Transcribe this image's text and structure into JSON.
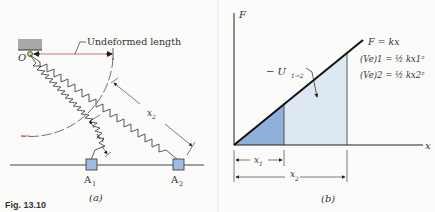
{
  "caption": "Fig. 13.10",
  "panel_a": {
    "label": "(a)",
    "pivot_label": "O",
    "undeformed_label": "Undeformed length",
    "block1_label": "A",
    "block1_sub": "1",
    "block2_label": "A",
    "block2_sub": "2",
    "x1_label": "x",
    "x1_sub": "1",
    "x2_label": "x",
    "x2_sub": "2"
  },
  "panel_b": {
    "label": "(b)",
    "y_axis_label": "F",
    "x_axis_label": "x",
    "line_label": "F = kx",
    "work_label": "− U",
    "work_sub": "1→2",
    "energy1": "(Ve)1 = ½ kx1²",
    "energy2": "(Ve)2 = ½ kx2²",
    "x1_label": "x",
    "x1_sub": "1",
    "x2_label": "x",
    "x2_sub": "2"
  },
  "colors": {
    "dark_fill": "#8fb0d8",
    "light_fill": "#dde8f2",
    "block_fill": "#9dbde0",
    "line": "#1a1a1a",
    "wall": "#a8a8a8",
    "red": "#c0392b"
  }
}
